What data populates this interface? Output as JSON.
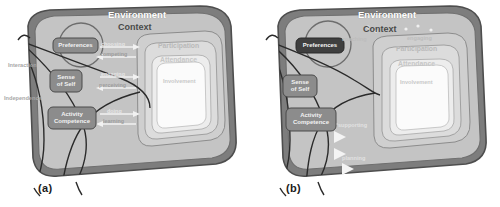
{
  "figure": {
    "type": "conceptual-model-diagram",
    "panels": [
      {
        "id": "a",
        "caption": "(a)",
        "outer_ring_label": "Environment",
        "context_label": "Context",
        "rings": [
          "Participation",
          "Attendance",
          "Involvement"
        ],
        "boxes": [
          {
            "id": "preferences",
            "label": "Preferences"
          },
          {
            "id": "sense-of-self",
            "label_line1": "Sense",
            "label_line2": "of Self"
          },
          {
            "id": "activity-competence",
            "label_line1": "Activity",
            "label_line2": "Competence"
          }
        ],
        "arrow_labels": [
          {
            "id": "choosing",
            "text": "choosing"
          },
          {
            "id": "competing",
            "text": "competing"
          },
          {
            "id": "engaging",
            "text": "engaging"
          },
          {
            "id": "perceiving",
            "text": "perceiving"
          },
          {
            "id": "doing",
            "text": "doing"
          },
          {
            "id": "learning",
            "text": "learning"
          }
        ],
        "side_labels": [
          {
            "id": "interaction",
            "text": "Interaction"
          },
          {
            "id": "independence",
            "text": "Independence"
          }
        ]
      },
      {
        "id": "b",
        "caption": "(b)",
        "outer_ring_label": "Environment",
        "context_label": "Context",
        "rings": [
          "Participation",
          "Attendance",
          "Involvement"
        ],
        "boxes": [
          {
            "id": "preferences",
            "label": "Preferences"
          },
          {
            "id": "sense-of-self",
            "label_line1": "Sense",
            "label_line2": "of Self"
          },
          {
            "id": "activity-competence",
            "label_line1": "Activity",
            "label_line2": "Competence"
          }
        ],
        "arrow_labels": [
          {
            "id": "coaching",
            "text": "coaching"
          },
          {
            "id": "engaging",
            "text": "engaging"
          },
          {
            "id": "supporting",
            "text": "supporting"
          },
          {
            "id": "planning",
            "text": "planning"
          }
        ],
        "side_labels": []
      }
    ]
  },
  "colors": {
    "outer_ring": "#7d7d7d",
    "context_fill": "#c4c4c4",
    "ring_participation": "#cfcfcf",
    "ring_attendance": "#dcdcdc",
    "ring_inner": "#ededed",
    "ring_core": "#fbfbfb",
    "box_fill": "#8c8c8c",
    "stroke": "#5a5a5a",
    "background": "#ffffff",
    "arrow_light": "#f0f0f0"
  }
}
